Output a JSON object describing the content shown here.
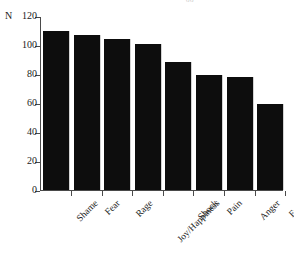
{
  "figure": {
    "top_fragment": "oo",
    "axis_unit_label": "N"
  },
  "chart_data": {
    "type": "bar",
    "title": "",
    "xlabel": "",
    "ylabel": "N",
    "categories": [
      "Shame",
      "Fear",
      "Rage",
      "Joy/Happiness",
      "Shock",
      "Pain",
      "Anger",
      "Envy"
    ],
    "values": [
      110,
      107,
      104,
      101,
      88,
      79,
      78,
      59
    ],
    "ylim": [
      0,
      120
    ],
    "yticks": [
      0,
      20,
      40,
      60,
      80,
      100,
      120
    ],
    "ytick_labels": [
      "0",
      "20",
      "40",
      "60",
      "80",
      "100",
      "120"
    ],
    "grid": false,
    "legend": false,
    "bar_color": "#0d0d0d",
    "axis_color": "#4a4a4a",
    "background": "#ffffff"
  }
}
